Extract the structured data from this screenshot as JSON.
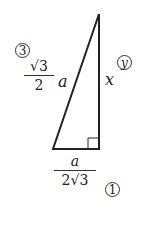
{
  "diagram": {
    "type": "right-triangle",
    "hypotenuse_label": {
      "coef_num": "3",
      "coef_den": "2",
      "variable": "a",
      "radical": "√",
      "marker": "3"
    },
    "vertical_side_label": {
      "variable": "x",
      "marker": "y"
    },
    "base_label": {
      "num": "a",
      "den_coef": "2",
      "den_radical": "√",
      "den_radicand": "3",
      "marker": "1"
    },
    "colors": {
      "stroke": "#222222",
      "background": "#ffffff"
    }
  }
}
